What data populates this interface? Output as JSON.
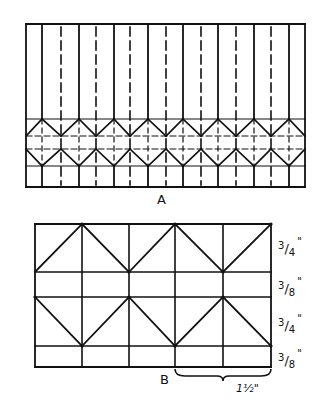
{
  "figure": {
    "background": "#ffffff",
    "ink": "#111111"
  },
  "diagram_a": {
    "label": "A",
    "frame": {
      "x1": 26,
      "y1": 24,
      "x2": 305,
      "y2": 187
    },
    "solid_verticals_x": [
      42,
      79,
      114,
      148,
      183,
      218,
      254,
      289
    ],
    "dashed_verticals_x": [
      61,
      96,
      130,
      166,
      201,
      236,
      271
    ],
    "solid_horizontals_y": [
      119,
      166
    ],
    "dashed_horizontals_y": [
      136,
      149
    ],
    "hexagon_band": {
      "top": 119,
      "upper_mid": 136,
      "lower_mid": 149,
      "bottom": 166
    }
  },
  "diagram_b": {
    "label": "B",
    "frame": {
      "x1": 35,
      "y1": 224,
      "x2": 271,
      "y2": 367
    },
    "verticals_x": [
      82,
      129,
      175,
      223
    ],
    "horizontals_y": [
      272,
      297,
      346
    ],
    "dimensions": [
      {
        "text_num": "3",
        "text_den": "4",
        "unit": "\"",
        "y": 240
      },
      {
        "text_num": "3",
        "text_den": "8",
        "unit": "\"",
        "y": 280
      },
      {
        "text_num": "3",
        "text_den": "4",
        "unit": "\"",
        "y": 317
      },
      {
        "text_num": "3",
        "text_den": "8",
        "unit": "\"",
        "y": 352
      }
    ],
    "brace": {
      "x1": 175,
      "x2": 271,
      "y": 369,
      "label": "1½\""
    }
  }
}
